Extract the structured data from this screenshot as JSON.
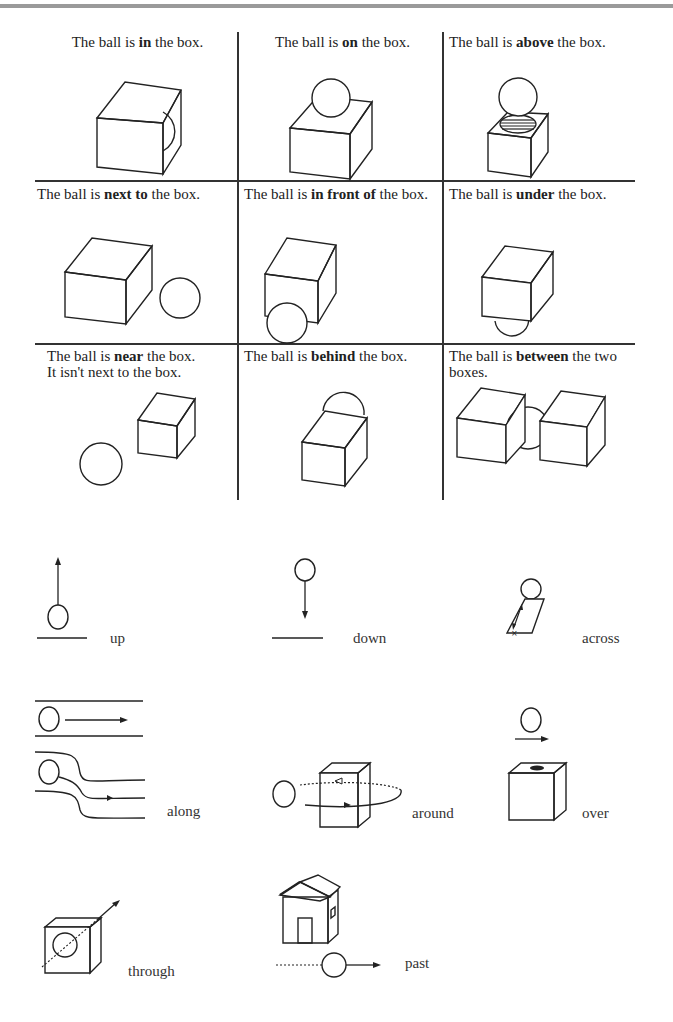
{
  "grid": {
    "cells": [
      {
        "pre": "The ball is ",
        "keyword": "in",
        "post": " the box.",
        "line2": ""
      },
      {
        "pre": "The ball is ",
        "keyword": "on",
        "post": " the box.",
        "line2": ""
      },
      {
        "pre": "The ball is ",
        "keyword": "above",
        "post": " the box.",
        "line2": ""
      },
      {
        "pre": "The ball is ",
        "keyword": "next to",
        "post": " the box.",
        "line2": ""
      },
      {
        "pre": "The ball is ",
        "keyword": "in front of",
        "post": " the box.",
        "line2": ""
      },
      {
        "pre": "The ball is ",
        "keyword": "under",
        "post": " the box.",
        "line2": ""
      },
      {
        "pre": "The ball is ",
        "keyword": "near",
        "post": " the box.",
        "line2": "It isn't next to the box."
      },
      {
        "pre": "The ball is ",
        "keyword": "behind",
        "post": " the box.",
        "line2": ""
      },
      {
        "pre": "The ball is ",
        "keyword": "between",
        "post": " the two boxes.",
        "line2": ""
      }
    ]
  },
  "motion": {
    "items": [
      {
        "label": "up"
      },
      {
        "label": "down"
      },
      {
        "label": "across"
      },
      {
        "label": "along"
      },
      {
        "label": "around"
      },
      {
        "label": "over"
      },
      {
        "label": "through"
      },
      {
        "label": "past"
      }
    ]
  }
}
